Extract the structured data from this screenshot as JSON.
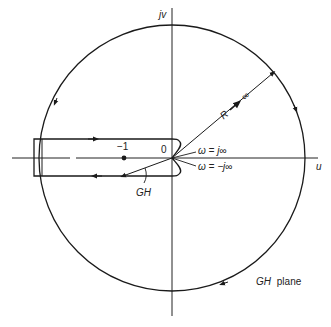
{
  "diagram": {
    "title": "GH plane",
    "axes": {
      "vertical_label": "jv",
      "horizontal_label": "u"
    },
    "labels": {
      "origin": "0",
      "minus_one": "−1",
      "radius": "R",
      "radius_arrow": "→",
      "infinity": "∞",
      "omega_plus": "ω = j∞",
      "omega_minus": "ω = −j∞",
      "gh": "GH",
      "plane_gh": "GH",
      "plane_word": "plane"
    },
    "colors": {
      "stroke": "#1a1a1a",
      "background": "#ffffff"
    }
  }
}
